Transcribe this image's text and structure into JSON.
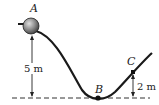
{
  "diagram": {
    "points": {
      "A": {
        "label": "A",
        "x": 31,
        "y": 26
      },
      "B": {
        "label": "B",
        "x": 98,
        "y": 98
      },
      "C": {
        "label": "C",
        "x": 133,
        "y": 72
      }
    },
    "dimensions": {
      "height_A": "5 m",
      "height_C": "2 m"
    },
    "colors": {
      "track": "#1a1a1a",
      "ball": "#8a8a8a",
      "baseline": "#333333"
    }
  }
}
